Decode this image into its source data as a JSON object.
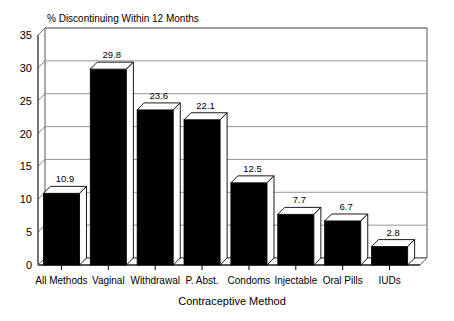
{
  "chart_data": {
    "type": "bar",
    "title": "% Discontinuing Within 12 Months",
    "xlabel": "Contraceptive Method",
    "ylabel": "",
    "categories": [
      "All Methods",
      "Vaginal",
      "Withdrawal",
      "P. Abst.",
      "Condoms",
      "Injectable",
      "Oral Pills",
      "IUDs"
    ],
    "values": [
      10.9,
      29.8,
      23.6,
      22.1,
      12.5,
      7.7,
      6.7,
      2.8
    ],
    "value_labels": [
      "10.9",
      "29.8",
      "23.6",
      "22.1",
      "12.5",
      "7.7",
      "6.7",
      "2.8"
    ],
    "ylim": [
      0,
      35
    ],
    "yticks": [
      0,
      5,
      10,
      15,
      20,
      25,
      30,
      35
    ],
    "ytick_labels": [
      "0",
      "5",
      "10",
      "15",
      "20",
      "25",
      "30",
      "35"
    ],
    "grid": true,
    "legend": false,
    "style": "3d-column",
    "bar_color": "#000000",
    "grid_color": "#8a8a8a",
    "axis_color": "#000000",
    "background": "#ffffff"
  }
}
